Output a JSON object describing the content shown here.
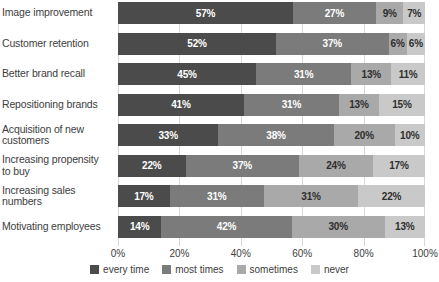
{
  "chart_data": {
    "type": "bar",
    "subtype": "stacked-horizontal-100",
    "title": "",
    "subtitle": "",
    "xlabel": "",
    "ylabel": "",
    "xlim": [
      0,
      100
    ],
    "xticks": [
      "0%",
      "20%",
      "40%",
      "60%",
      "80%",
      "100%"
    ],
    "xtick_values": [
      0,
      20,
      40,
      60,
      80,
      100
    ],
    "grid": true,
    "legend_position": "bottom-center",
    "categories": [
      "Image improvement",
      "Customer retention",
      "Better brand recall",
      "Repositioning brands",
      "Acquisition of new customers",
      "Increasing propensity to buy",
      "Increasing sales numbers",
      "Motivating employees"
    ],
    "series": [
      {
        "name": "every time",
        "color": "#4b4b4b",
        "values": [
          57,
          52,
          45,
          41,
          33,
          22,
          17,
          14
        ],
        "labels": [
          "57%",
          "52%",
          "45%",
          "41%",
          "33%",
          "22%",
          "17%",
          "14%"
        ]
      },
      {
        "name": "most times",
        "color": "#7b7b7b",
        "values": [
          27,
          37,
          31,
          31,
          38,
          37,
          31,
          42
        ],
        "labels": [
          "27%",
          "37%",
          "31%",
          "31%",
          "38%",
          "37%",
          "31%",
          "42%"
        ]
      },
      {
        "name": "sometimes",
        "color": "#a9a9a9",
        "values": [
          9,
          6,
          13,
          13,
          20,
          24,
          31,
          30
        ],
        "labels": [
          "9%",
          "6%",
          "13%",
          "13%",
          "20%",
          "24%",
          "31%",
          "30%"
        ]
      },
      {
        "name": "never",
        "color": "#c9c9c9",
        "values": [
          7,
          6,
          11,
          15,
          10,
          17,
          22,
          13
        ],
        "labels": [
          "7%",
          "6%",
          "11%",
          "15%",
          "10%",
          "17%",
          "22%",
          "13%"
        ]
      }
    ]
  },
  "legend": {
    "items": [
      {
        "label": "every time",
        "color": "#4b4b4b"
      },
      {
        "label": "most times",
        "color": "#7b7b7b"
      },
      {
        "label": "sometimes",
        "color": "#a9a9a9"
      },
      {
        "label": "never",
        "color": "#c9c9c9"
      }
    ]
  },
  "colors": {
    "every_time": "#4b4b4b",
    "most_times": "#7b7b7b",
    "sometimes": "#a9a9a9",
    "never": "#c9c9c9",
    "gridline": "#d8d8d8",
    "text": "#3d3d3d",
    "background": "#ffffff"
  }
}
